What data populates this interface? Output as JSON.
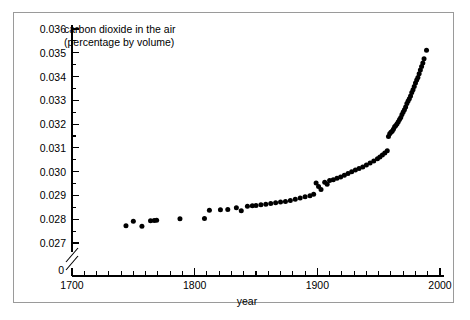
{
  "chart_data": {
    "type": "scatter",
    "title": "carbon dioxide in the air",
    "subtitle": "(percentage by volume)",
    "xlabel": "year",
    "ylabel": "",
    "xlim": [
      1700,
      2000
    ],
    "ylim": [
      0.0265,
      0.036
    ],
    "grid": false,
    "legend": null,
    "y_axis_break": true,
    "y_break_label": "0",
    "x_ticks_major": [
      1700,
      1800,
      1900,
      2000
    ],
    "x_tick_labels": [
      "1700",
      "1800",
      "1900",
      "2000"
    ],
    "x_tick_minor_step": 10,
    "y_ticks_major": [
      0.027,
      0.028,
      0.029,
      0.03,
      0.031,
      0.032,
      0.033,
      0.034,
      0.035,
      0.036
    ],
    "y_tick_labels": [
      "0.027",
      "0.028",
      "0.029",
      "0.030",
      "0.031",
      "0.032",
      "0.033",
      "0.034",
      "0.035",
      "0.036"
    ],
    "y_tick_minor_step": 0.0005,
    "series": [
      {
        "name": "carbon dioxide in the air",
        "marker": "circle",
        "color": "#000000",
        "points": [
          [
            1744,
            0.02773
          ],
          [
            1750,
            0.02791
          ],
          [
            1757,
            0.0277
          ],
          [
            1764,
            0.02794
          ],
          [
            1767,
            0.02795
          ],
          [
            1769,
            0.02796
          ],
          [
            1788,
            0.02802
          ],
          [
            1808,
            0.02803
          ],
          [
            1812,
            0.02838
          ],
          [
            1821,
            0.0284
          ],
          [
            1827,
            0.02841
          ],
          [
            1834,
            0.02848
          ],
          [
            1838,
            0.02836
          ],
          [
            1843,
            0.02855
          ],
          [
            1847,
            0.02857
          ],
          [
            1850,
            0.02858
          ],
          [
            1854,
            0.02861
          ],
          [
            1858,
            0.02863
          ],
          [
            1862,
            0.02866
          ],
          [
            1866,
            0.02869
          ],
          [
            1870,
            0.02872
          ],
          [
            1874,
            0.02875
          ],
          [
            1878,
            0.02879
          ],
          [
            1882,
            0.02884
          ],
          [
            1886,
            0.02889
          ],
          [
            1890,
            0.02894
          ],
          [
            1894,
            0.02899
          ],
          [
            1897,
            0.02905
          ],
          [
            1899,
            0.02952
          ],
          [
            1901,
            0.02938
          ],
          [
            1903,
            0.02925
          ],
          [
            1906,
            0.02955
          ],
          [
            1908,
            0.02947
          ],
          [
            1910,
            0.02963
          ],
          [
            1913,
            0.02966
          ],
          [
            1916,
            0.02972
          ],
          [
            1919,
            0.02978
          ],
          [
            1922,
            0.02985
          ],
          [
            1925,
            0.02992
          ],
          [
            1928,
            0.03
          ],
          [
            1931,
            0.03007
          ],
          [
            1934,
            0.03013
          ],
          [
            1937,
            0.0302
          ],
          [
            1940,
            0.03028
          ],
          [
            1943,
            0.03036
          ],
          [
            1946,
            0.03045
          ],
          [
            1949,
            0.03054
          ],
          [
            1951,
            0.03062
          ],
          [
            1953,
            0.0307
          ],
          [
            1955,
            0.03078
          ],
          [
            1957,
            0.03088
          ],
          [
            1958,
            0.03148
          ],
          [
            1959,
            0.03159
          ],
          [
            1960,
            0.03166
          ],
          [
            1961,
            0.0317
          ],
          [
            1962,
            0.03178
          ],
          [
            1963,
            0.03189
          ],
          [
            1964,
            0.03194
          ],
          [
            1965,
            0.03201
          ],
          [
            1966,
            0.0321
          ],
          [
            1967,
            0.03219
          ],
          [
            1968,
            0.03228
          ],
          [
            1969,
            0.0324
          ],
          [
            1970,
            0.03251
          ],
          [
            1971,
            0.0326
          ],
          [
            1972,
            0.03272
          ],
          [
            1973,
            0.03287
          ],
          [
            1974,
            0.03297
          ],
          [
            1975,
            0.03307
          ],
          [
            1976,
            0.03318
          ],
          [
            1977,
            0.03333
          ],
          [
            1978,
            0.03345
          ],
          [
            1979,
            0.03358
          ],
          [
            1980,
            0.03373
          ],
          [
            1981,
            0.03385
          ],
          [
            1982,
            0.03396
          ],
          [
            1983,
            0.03412
          ],
          [
            1984,
            0.03428
          ],
          [
            1985,
            0.03442
          ],
          [
            1986,
            0.03457
          ],
          [
            1987,
            0.03475
          ],
          [
            1989,
            0.03511
          ]
        ]
      }
    ]
  }
}
